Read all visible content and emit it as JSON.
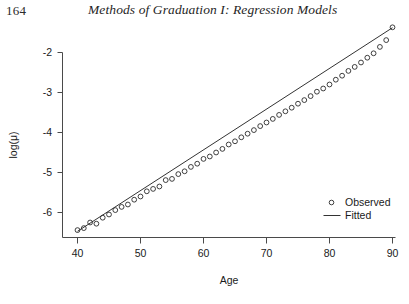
{
  "page": {
    "folio": "164",
    "running_title": "Methods of Graduation I: Regression Models"
  },
  "figure": {
    "x_axis_label": "Age",
    "y_axis_label": "log(μ)",
    "legend": {
      "position": "inside-lower-right",
      "entries": [
        {
          "label": "Observed",
          "marker": "open-circle",
          "color": "#2a2a2a"
        },
        {
          "label": "Fitted",
          "marker": "line",
          "color": "#333333"
        }
      ]
    }
  },
  "chart_data": {
    "type": "scatter",
    "title": "",
    "subtitle": "",
    "xlabel": "Age",
    "ylabel": "log(μ)",
    "xlim": [
      39.4,
      91.0
    ],
    "ylim": [
      -6.6,
      -1.25
    ],
    "xticks": [
      40,
      50,
      60,
      70,
      80,
      90
    ],
    "yticks": [
      -2,
      -3,
      -4,
      -5,
      -6
    ],
    "xtick_labels": [
      "40",
      "50",
      "60",
      "70",
      "80",
      "90"
    ],
    "ytick_labels": [
      "-2",
      "-3",
      "-4",
      "-5",
      "-6"
    ],
    "grid": false,
    "legend_position": "lower right",
    "series": [
      {
        "name": "Observed",
        "type": "scatter",
        "marker": "open-circle",
        "color": "#2a2a2a",
        "x": [
          40,
          41,
          42,
          43,
          44,
          45,
          46,
          47,
          48,
          49,
          50,
          51,
          52,
          53,
          54,
          55,
          56,
          57,
          58,
          59,
          60,
          61,
          62,
          63,
          64,
          65,
          66,
          67,
          68,
          69,
          70,
          71,
          72,
          73,
          74,
          75,
          76,
          77,
          78,
          79,
          80,
          81,
          82,
          83,
          84,
          85,
          86,
          87,
          88,
          89,
          90
        ],
        "y": [
          -6.44,
          -6.39,
          -6.25,
          -6.28,
          -6.13,
          -6.05,
          -5.94,
          -5.86,
          -5.8,
          -5.68,
          -5.6,
          -5.47,
          -5.41,
          -5.35,
          -5.19,
          -5.16,
          -5.04,
          -4.97,
          -4.86,
          -4.78,
          -4.66,
          -4.6,
          -4.5,
          -4.41,
          -4.3,
          -4.22,
          -4.12,
          -4.03,
          -3.94,
          -3.84,
          -3.75,
          -3.66,
          -3.56,
          -3.47,
          -3.38,
          -3.28,
          -3.19,
          -3.09,
          -2.98,
          -2.9,
          -2.8,
          -2.68,
          -2.58,
          -2.46,
          -2.36,
          -2.25,
          -2.13,
          -2.02,
          -1.86,
          -1.69,
          -1.37
        ]
      },
      {
        "name": "Fitted",
        "type": "line",
        "color": "#333333",
        "x": [
          40,
          90
        ],
        "y": [
          -6.47,
          -1.38
        ],
        "slope": 0.1018,
        "intercept": -10.542
      }
    ]
  }
}
